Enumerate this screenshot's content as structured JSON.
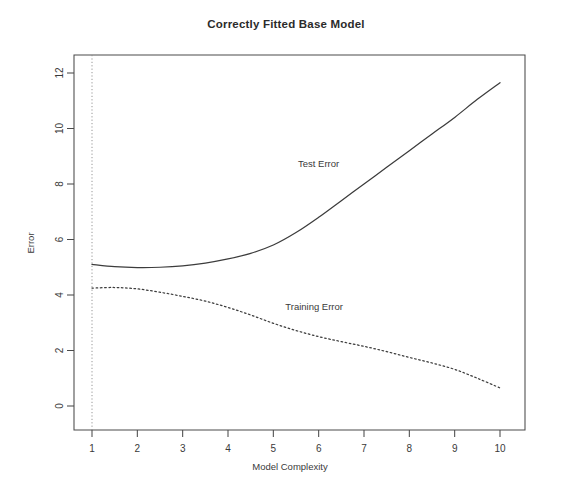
{
  "chart_data": {
    "type": "line",
    "title": "Correctly Fitted Base Model",
    "xlabel": "Model Complexity",
    "ylabel": "Error",
    "xlim": [
      1,
      10
    ],
    "ylim": [
      0,
      12.5
    ],
    "xticks": [
      "1",
      "2",
      "3",
      "4",
      "5",
      "6",
      "7",
      "8",
      "9",
      "10"
    ],
    "yticks": [
      "0",
      "2",
      "4",
      "6",
      "8",
      "10",
      "12"
    ],
    "grid": false,
    "legend_position": "inline-annotation",
    "annotations": [
      {
        "text": "Test Error",
        "x": 6.0,
        "y": 8.6
      },
      {
        "text": "Training Error",
        "x": 5.9,
        "y": 3.45
      }
    ],
    "reference_lines": [
      {
        "orientation": "vertical",
        "x": 1,
        "style": "dotted"
      }
    ],
    "x": [
      1,
      1.5,
      2,
      2.5,
      3,
      3.5,
      4,
      4.5,
      5,
      5.5,
      6,
      6.5,
      7,
      7.5,
      8,
      8.5,
      9,
      9.5,
      10
    ],
    "series": [
      {
        "name": "Test Error",
        "style": "solid",
        "color": "#3c3c3c",
        "values": [
          5.1,
          5.02,
          4.99,
          5.0,
          5.05,
          5.15,
          5.3,
          5.5,
          5.8,
          6.25,
          6.8,
          7.4,
          8.0,
          8.6,
          9.2,
          9.8,
          10.4,
          11.05,
          11.65
        ]
      },
      {
        "name": "Training Error",
        "style": "dotted",
        "color": "#3c3c3c",
        "values": [
          4.25,
          4.27,
          4.22,
          4.1,
          3.95,
          3.78,
          3.55,
          3.28,
          2.98,
          2.72,
          2.5,
          2.32,
          2.15,
          1.96,
          1.75,
          1.55,
          1.32,
          1.0,
          0.65
        ]
      }
    ]
  }
}
